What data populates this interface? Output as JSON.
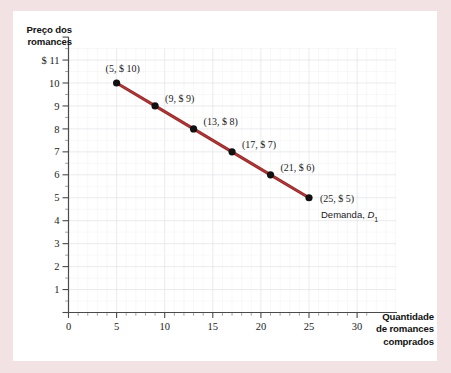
{
  "figure": {
    "background_color": "#f3e2e4",
    "plate_color": "#ffffff",
    "line_color": "#9c2a2a"
  },
  "axes": {
    "y_title": "Preço dos\nromances",
    "x_title": "Quantidade\nde romances\ncomprados",
    "y_ticks": [
      "$ 11",
      "10",
      "9",
      "8",
      "7",
      "6",
      "5",
      "4",
      "3",
      "2",
      "1"
    ],
    "x_ticks": [
      "0",
      "5",
      "10",
      "15",
      "20",
      "25",
      "30"
    ],
    "origin_label": "0"
  },
  "annotations": {
    "curve_name": "Demanda, ",
    "curve_symbol": "D",
    "curve_subscript": "1"
  },
  "chart_data": {
    "type": "line",
    "title": "",
    "subtitle": "",
    "xlabel": "Quantidade de romances comprados",
    "ylabel": "Preço dos romances",
    "xlim": [
      0,
      32
    ],
    "ylim": [
      0,
      11.6
    ],
    "grid": true,
    "legend_position": "inline-annotation",
    "series": [
      {
        "name": "Demanda, D1",
        "color": "#9c2a2a",
        "marker": "circle",
        "x": [
          5,
          9,
          13,
          17,
          21,
          25
        ],
        "y": [
          10,
          9,
          8,
          7,
          6,
          5
        ],
        "point_labels": [
          "(5, $ 10)",
          "(9, $ 9)",
          "(13, $ 8)",
          "(17, $ 7)",
          "(21, $ 6)",
          "(25, $ 5)"
        ]
      }
    ],
    "x_tick_values": [
      0,
      5,
      10,
      15,
      20,
      25,
      30
    ],
    "y_tick_values": [
      1,
      2,
      3,
      4,
      5,
      6,
      7,
      8,
      9,
      10,
      11
    ],
    "x_minor_tick_step": 1,
    "y_minor_tick_step": 0.5
  }
}
